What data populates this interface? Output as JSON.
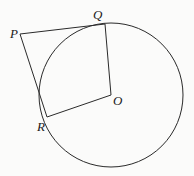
{
  "diagram": {
    "type": "geometry",
    "points": {
      "P": {
        "label": "P",
        "x": 20,
        "y": 34
      },
      "Q": {
        "label": "Q",
        "x": 105,
        "y": 24
      },
      "R": {
        "label": "R",
        "x": 47,
        "y": 117
      },
      "O": {
        "label": "O",
        "x": 111,
        "y": 95
      }
    },
    "circle": {
      "center": "O",
      "cx": 111,
      "cy": 95,
      "r": 72
    },
    "segments": [
      {
        "from": "P",
        "to": "Q"
      },
      {
        "from": "P",
        "to": "R"
      },
      {
        "from": "Q",
        "to": "O"
      },
      {
        "from": "O",
        "to": "R"
      }
    ],
    "colors": {
      "stroke": "#2a2a2a",
      "background": "#fbfbfa"
    }
  }
}
